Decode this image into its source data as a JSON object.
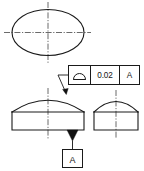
{
  "drawing": {
    "title": "Profile of a surface tolerance drawing",
    "background_color": "#ffffff",
    "line_color": "#1a1a1a",
    "centerline_color": "#3a3a3a"
  },
  "feature_control_frame": {
    "symbol_name": "profile-of-a-surface",
    "tolerance_value": "0.02",
    "datum_reference": "A"
  },
  "datum_feature": {
    "letter": "A"
  },
  "views": {
    "top": {
      "name": "top-view-ellipse"
    },
    "front": {
      "name": "front-view-dome"
    },
    "side": {
      "name": "side-view-dome"
    }
  }
}
